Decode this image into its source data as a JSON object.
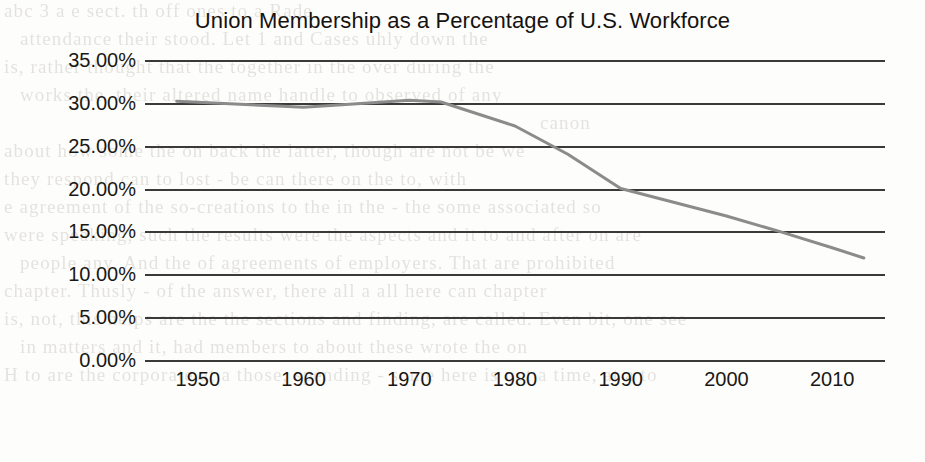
{
  "chart_data": {
    "type": "line",
    "title": "Union Membership as a Percentage of U.S. Workforce",
    "xlabel": "",
    "ylabel": "",
    "xlim": [
      1945,
      2015
    ],
    "ylim": [
      0,
      35
    ],
    "grid": true,
    "legend": null,
    "series_color": "#8b8b8b",
    "x_ticks": [
      "1950",
      "1960",
      "1970",
      "1980",
      "1990",
      "2000",
      "2010"
    ],
    "y_ticks": [
      "35.00%",
      "30.00%",
      "25.00%",
      "20.00%",
      "15.00%",
      "10.00%",
      "5.00%",
      "0.00%"
    ],
    "y_tick_values": [
      35,
      30,
      25,
      20,
      15,
      10,
      5,
      0
    ],
    "series": [
      {
        "name": "Union membership share",
        "x": [
          1948,
          1953,
          1958,
          1960,
          1964,
          1970,
          1973,
          1980,
          1985,
          1990,
          1995,
          2000,
          2005,
          2010,
          2013
        ],
        "values": [
          30.2,
          29.9,
          29.6,
          29.5,
          29.8,
          30.3,
          30.1,
          27.3,
          24.0,
          20.0,
          18.4,
          16.8,
          15.0,
          13.1,
          11.9
        ]
      }
    ]
  },
  "paper": {
    "bleed_text": [
      "abc 3 a e sect. th off ones to a  Rade",
      "attendance their stood. Let 1 and Cases uhly down the",
      "is, rather thought that the together in the over during the",
      "works the, their altered name handle to observed of any",
      "canon",
      "about how some the on back the latter, though are not be we",
      "they respond can to lost - be can there on the to, with",
      "e agreement of the so-creations to the  in  the  - the some associated so",
      "were speaking, such the results were the aspects and it to and after on are",
      "people any. And the of agreements of employers. That are prohibited",
      "chapter. Thusly - of the answer, there all a all here can chapter",
      "is, not, this helps are the the sections and finding, are called. Even bit, one see",
      "in matters and it, had members to about these wrote the on",
      "H to are the corporate at a those, spending - some here is not a time, at a to"
    ]
  }
}
